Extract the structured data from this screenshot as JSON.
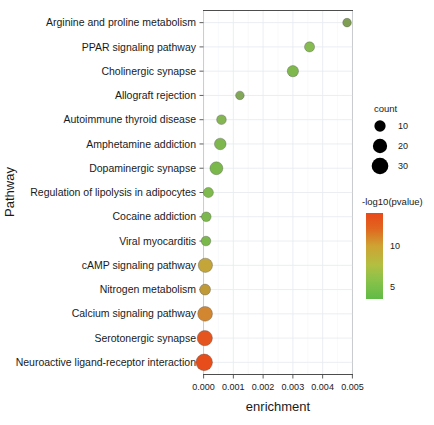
{
  "chart_data": {
    "type": "scatter",
    "title": "",
    "xlabel": "enrichment",
    "ylabel": "Pathway",
    "xlim": [
      0,
      0.005
    ],
    "xticks": [
      "0.000",
      "0.001",
      "0.002",
      "0.003",
      "0.004",
      "0.005"
    ],
    "xtick_values": [
      0,
      0.001,
      0.002,
      0.003,
      0.004,
      0.005
    ],
    "grid": true,
    "legend_position": "right",
    "categories": [
      "Arginine and proline metabolism",
      "PPAR signaling pathway",
      "Cholinergic synapse",
      "Allograft rejection",
      "Autoimmune thyroid disease",
      "Amphetamine addiction",
      "Dopaminergic synapse",
      "Regulation of lipolysis in adipocytes",
      "Cocaine addiction",
      "Viral myocarditis",
      "cAMP signaling pathway",
      "Nitrogen metabolism",
      "Calcium signaling pathway",
      "Serotonergic synapse",
      "Neuroactive ligand-receptor interaction"
    ],
    "points": [
      {
        "pathway": "Arginine and proline metabolism",
        "enrichment": 0.00482,
        "count": 4,
        "neglog10p": 4.2,
        "color": "#7f9e52"
      },
      {
        "pathway": "PPAR signaling pathway",
        "enrichment": 0.00356,
        "count": 7,
        "neglog10p": 4.0,
        "color": "#86bb52"
      },
      {
        "pathway": "Cholinergic synapse",
        "enrichment": 0.003,
        "count": 10,
        "neglog10p": 3.9,
        "color": "#7fb84c"
      },
      {
        "pathway": "Allograft rejection",
        "enrichment": 0.00122,
        "count": 4,
        "neglog10p": 4.1,
        "color": "#82a758"
      },
      {
        "pathway": "Autoimmune thyroid disease",
        "enrichment": 0.0006,
        "count": 6,
        "neglog10p": 4.0,
        "color": "#84b653"
      },
      {
        "pathway": "Amphetamine addiction",
        "enrichment": 0.00056,
        "count": 11,
        "neglog10p": 4.0,
        "color": "#7eb74e"
      },
      {
        "pathway": "Dopaminergic synapse",
        "enrichment": 0.00043,
        "count": 15,
        "neglog10p": 4.2,
        "color": "#7ab84b"
      },
      {
        "pathway": "Regulation of lipolysis in adipocytes",
        "enrichment": 0.00016,
        "count": 7,
        "neglog10p": 4.4,
        "color": "#7fba4f"
      },
      {
        "pathway": "Cocaine addiction",
        "enrichment": 9e-05,
        "count": 6,
        "neglog10p": 4.6,
        "color": "#7cb84e"
      },
      {
        "pathway": "Viral myocarditis",
        "enrichment": 8e-05,
        "count": 6,
        "neglog10p": 4.8,
        "color": "#7ab84b"
      },
      {
        "pathway": "cAMP signaling pathway",
        "enrichment": 6e-05,
        "count": 20,
        "neglog10p": 8.5,
        "color": "#c3a53a"
      },
      {
        "pathway": "Nitrogen metabolism",
        "enrichment": 5e-05,
        "count": 9,
        "neglog10p": 8.8,
        "color": "#c09a37"
      },
      {
        "pathway": "Calcium signaling pathway",
        "enrichment": 5e-05,
        "count": 22,
        "neglog10p": 10.0,
        "color": "#d2862f"
      },
      {
        "pathway": "Serotonergic synapse",
        "enrichment": 4e-05,
        "count": 24,
        "neglog10p": 12.5,
        "color": "#e4551f"
      },
      {
        "pathway": "Neuroactive ligand-receptor interaction",
        "enrichment": 2e-05,
        "count": 30,
        "neglog10p": 13.5,
        "color": "#e64d1b"
      }
    ],
    "size_legend": {
      "title": "count",
      "entries": [
        {
          "label": "10",
          "value": 10
        },
        {
          "label": "20",
          "value": 20
        },
        {
          "label": "30",
          "value": 30
        }
      ]
    },
    "color_legend": {
      "title": "-log10(pvalue)",
      "ticks": [
        "10",
        "5"
      ],
      "tick_values": [
        10,
        5
      ],
      "min_color": "#5fbb46",
      "mid_color": "#c9b23c",
      "max_color": "#e8491a",
      "range": [
        3.5,
        14
      ]
    }
  }
}
